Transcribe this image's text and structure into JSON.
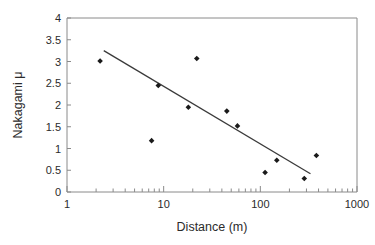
{
  "chart_data": {
    "type": "scatter",
    "title": "",
    "xlabel": "Distance (m)",
    "ylabel": "Nakagami μ",
    "xscale": "log",
    "yscale": "linear",
    "xlim": [
      1,
      1000
    ],
    "ylim": [
      0,
      4
    ],
    "grid": false,
    "legend": null,
    "x_tick_labels": [
      "1",
      "10",
      "100",
      "1000"
    ],
    "x_tick_values": [
      1,
      10,
      100,
      1000
    ],
    "y_tick_labels": [
      "0",
      "0.5",
      "1",
      "1.5",
      "2",
      "2.5",
      "3",
      "3.5",
      "4"
    ],
    "y_tick_values": [
      0,
      0.5,
      1,
      1.5,
      2,
      2.5,
      3,
      3.5,
      4
    ],
    "marker": "filled-diamond",
    "marker_color": "#1a1a1a",
    "series": [
      {
        "name": "Nakagami μ measurements",
        "type": "scatter",
        "points": [
          {
            "x": 2.2,
            "y": 3.01
          },
          {
            "x": 7.5,
            "y": 1.18
          },
          {
            "x": 8.8,
            "y": 2.45
          },
          {
            "x": 18.0,
            "y": 1.95
          },
          {
            "x": 22.0,
            "y": 3.07
          },
          {
            "x": 45.0,
            "y": 1.86
          },
          {
            "x": 58.0,
            "y": 1.52
          },
          {
            "x": 112.0,
            "y": 0.45
          },
          {
            "x": 148.0,
            "y": 0.73
          },
          {
            "x": 285.0,
            "y": 0.31
          },
          {
            "x": 380.0,
            "y": 0.84
          }
        ]
      },
      {
        "name": "Linear fit (log-x)",
        "type": "line",
        "color": "#3a3a3a",
        "points": [
          {
            "x": 2.4,
            "y": 3.25
          },
          {
            "x": 330.0,
            "y": 0.42
          }
        ]
      }
    ]
  },
  "axes": {
    "x_axis_name": "Distance (m)",
    "y_axis_name": "Nakagami μ"
  }
}
